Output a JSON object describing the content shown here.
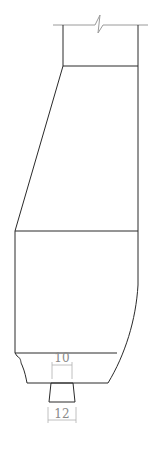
{
  "diagram": {
    "type": "technical-drawing",
    "colors": {
      "outline": "#2a2a2a",
      "break_line": "#9a9a9a",
      "dimension": "#8a8a8a"
    },
    "dimensions": [
      {
        "id": "dim-top",
        "label": "10"
      },
      {
        "id": "dim-bottom",
        "label": "12"
      }
    ]
  }
}
